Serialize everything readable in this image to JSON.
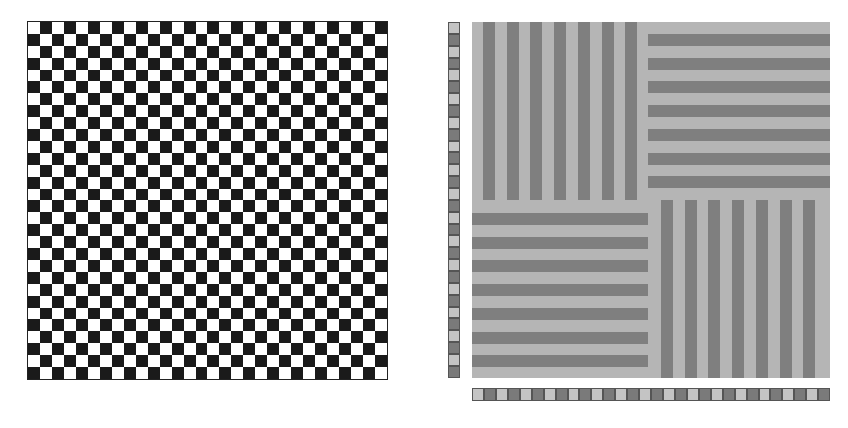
{
  "colors": {
    "checker_light": "#ffffff",
    "checker_dark": "#1a1a1a",
    "stripe_light": "#b5b5b5",
    "stripe_dark": "#7f7f7f",
    "strip_light": "#c4c4c4",
    "strip_dark": "#7a7a7a",
    "background": "#ffffff"
  },
  "checkerboard": {
    "rows": 30,
    "cols": 30,
    "top_left": "light"
  },
  "stripe_panel": {
    "quadrants": [
      {
        "name": "top-left",
        "orientation": "vertical",
        "dark_stripes": 7
      },
      {
        "name": "top-right",
        "orientation": "horizontal",
        "dark_stripes": 7
      },
      {
        "name": "bottom-left",
        "orientation": "horizontal",
        "dark_stripes": 7
      },
      {
        "name": "bottom-right",
        "orientation": "vertical",
        "dark_stripes": 7
      }
    ]
  },
  "left_strip": {
    "cells": 30,
    "first": "light"
  },
  "bottom_strip": {
    "cells": 30,
    "first": "light"
  }
}
